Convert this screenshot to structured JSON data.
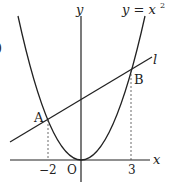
{
  "diagram": {
    "curve_label": "y = x",
    "curve_exponent": "2",
    "line_label": "l",
    "axis_x_label": "x",
    "axis_y_label": "y",
    "origin_label": "O",
    "point_a_label": "A",
    "point_b_label": "B",
    "tick_left": "−2",
    "tick_right": "3",
    "edge_fragment": ")",
    "colors": {
      "stroke": "#222222",
      "background": "#ffffff"
    }
  }
}
